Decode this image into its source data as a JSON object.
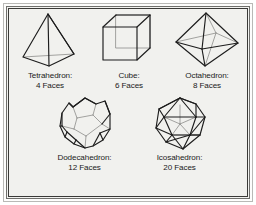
{
  "figure": {
    "background_color": "#f1f1ee",
    "border_color": "#3a3a38",
    "line_color": "#1d1d1d",
    "hidden_line_color": "#8d8d8a"
  },
  "solids": [
    {
      "id": "tetrahedron",
      "name": "Tetrahedron:",
      "faces_label": "4 Faces",
      "faces": 4,
      "vertices": 4,
      "edges": 6
    },
    {
      "id": "cube",
      "name": "Cube:",
      "faces_label": "6 Faces",
      "faces": 6,
      "vertices": 8,
      "edges": 12
    },
    {
      "id": "octahedron",
      "name": "Octahedron:",
      "faces_label": "8 Faces",
      "faces": 8,
      "vertices": 6,
      "edges": 12
    },
    {
      "id": "dodecahedron",
      "name": "Dodecahedron:",
      "faces_label": "12 Faces",
      "faces": 12,
      "vertices": 20,
      "edges": 30
    },
    {
      "id": "icosahedron",
      "name": "Icosahedron:",
      "faces_label": "20 Faces",
      "faces": 20,
      "vertices": 12,
      "edges": 30
    }
  ]
}
